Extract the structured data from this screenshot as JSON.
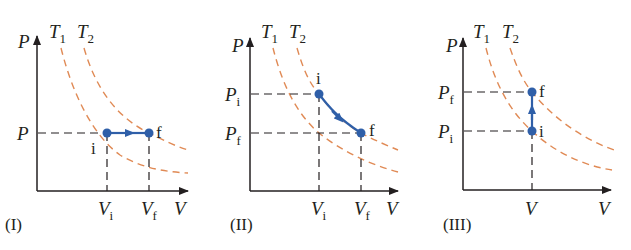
{
  "colors": {
    "axis": "#231f20",
    "isotherm": "#e08a55",
    "process": "#2f5fa8",
    "guide": "#231f20"
  },
  "isotherm_labels": {
    "t1": "T",
    "t1_sub": "1",
    "t2": "T",
    "t2_sub": "2"
  },
  "axis_labels": {
    "p": "P",
    "v": "V"
  },
  "point_labels": {
    "initial": "i",
    "final": "f"
  },
  "panels": [
    {
      "id": "I",
      "caption": "(I)",
      "process": "isobaric expansion",
      "y_ticks": [
        {
          "main": "P",
          "sub": ""
        }
      ],
      "x_ticks": [
        {
          "main": "V",
          "sub": "i"
        },
        {
          "main": "V",
          "sub": "f"
        }
      ]
    },
    {
      "id": "II",
      "caption": "(II)",
      "process": "expansion with decreasing pressure",
      "y_ticks": [
        {
          "main": "P",
          "sub": "i"
        },
        {
          "main": "P",
          "sub": "f"
        }
      ],
      "x_ticks": [
        {
          "main": "V",
          "sub": "i"
        },
        {
          "main": "V",
          "sub": "f"
        }
      ]
    },
    {
      "id": "III",
      "caption": "(III)",
      "process": "isochoric pressure increase",
      "y_ticks": [
        {
          "main": "P",
          "sub": "f"
        },
        {
          "main": "P",
          "sub": "i"
        }
      ],
      "x_ticks": [
        {
          "main": "V",
          "sub": ""
        }
      ]
    }
  ]
}
